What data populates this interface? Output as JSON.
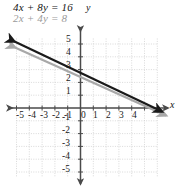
{
  "figure": {
    "title": "",
    "equations": {
      "primary": "4x + 8y = 16",
      "secondary": "2x + 4y = 8"
    },
    "axis_names": {
      "x": "x",
      "y": "y"
    },
    "colors": {
      "line_primary": "#1a1a1a",
      "line_secondary": "#a8a8a8",
      "axis": "#555555",
      "grid": "#cfcfcf",
      "text": "#1a1a1a",
      "text_secondary": "#9a9a9a",
      "background": "#ffffff"
    }
  },
  "chart_data": {
    "type": "line",
    "title": "",
    "xlabel": "x",
    "ylabel": "y",
    "xlim": [
      -5.6,
      5.2
    ],
    "ylim": [
      -5.6,
      5.6
    ],
    "grid": true,
    "grid_step": 1,
    "legend": "none",
    "xticks": [
      -5,
      -4,
      -3,
      -2,
      -1,
      0,
      1,
      2,
      3,
      4
    ],
    "xtick_labels": [
      "-5",
      "-4",
      "-3",
      "-2",
      "-1",
      "0",
      "1",
      "2",
      "3",
      "4"
    ],
    "yticks": [
      5,
      4,
      3,
      2,
      1,
      -1,
      -2,
      -3,
      -4,
      -5
    ],
    "ytick_labels": [
      "5",
      "4",
      "3",
      "2",
      "1",
      "-1",
      "-2",
      "-3",
      "-4",
      "-5"
    ],
    "series": [
      {
        "name": "4x + 8y = 16",
        "equation": "4x + 8y = 16",
        "slope": -0.5,
        "intercept": 2,
        "color": "#1a1a1a",
        "style": "double-arrow-line",
        "x": [
          -5.4,
          5.0
        ],
        "y": [
          4.7,
          -0.5
        ],
        "points": [
          {
            "x": 0,
            "y": 2
          },
          {
            "x": 4,
            "y": 0
          }
        ]
      },
      {
        "name": "2x + 4y = 8",
        "equation": "2x + 4y = 8",
        "slope": -0.5,
        "intercept": 2,
        "color": "#a8a8a8",
        "style": "double-arrow-line-overlapping",
        "x": [
          -5.4,
          5.1
        ],
        "y": [
          4.7,
          -0.55
        ],
        "points": [
          {
            "x": 0,
            "y": 2
          },
          {
            "x": 4,
            "y": 0
          }
        ]
      }
    ],
    "note": "Both equations describe the same line (coincident); the gray line lies underneath the black line."
  },
  "tick_positions": {
    "x": [
      {
        "label": "-5",
        "left": 16,
        "top": 110
      },
      {
        "label": "-4",
        "left": 28,
        "top": 110
      },
      {
        "label": "-3",
        "left": 40,
        "top": 110
      },
      {
        "label": "-2",
        "left": 52,
        "top": 110
      },
      {
        "label": "-1",
        "left": 64,
        "top": 110
      },
      {
        "label": "0",
        "left": 81,
        "top": 110
      },
      {
        "label": "1",
        "left": 93,
        "top": 110
      },
      {
        "label": "2",
        "left": 106,
        "top": 110
      },
      {
        "label": "3",
        "left": 119,
        "top": 110
      },
      {
        "label": "4",
        "left": 132,
        "top": 110
      }
    ],
    "y": [
      {
        "label": "5",
        "left": 66,
        "top": 34
      },
      {
        "label": "4",
        "left": 66,
        "top": 47
      },
      {
        "label": "3",
        "left": 66,
        "top": 60
      },
      {
        "label": "2",
        "left": 66,
        "top": 73
      },
      {
        "label": "1",
        "left": 66,
        "top": 86
      },
      {
        "label": "-1",
        "left": 62,
        "top": 112
      },
      {
        "label": "-2",
        "left": 62,
        "top": 125
      },
      {
        "label": "-3",
        "left": 62,
        "top": 138
      },
      {
        "label": "-4",
        "left": 62,
        "top": 151
      },
      {
        "label": "-5",
        "left": 62,
        "top": 164
      }
    ]
  }
}
